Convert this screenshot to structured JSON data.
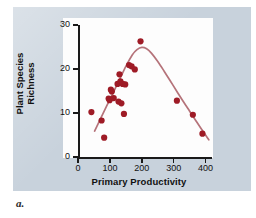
{
  "figure": {
    "caption": "a.",
    "panel_color": "#c8d2dc",
    "plot_background": "#fdfdfd"
  },
  "chart_data": {
    "type": "scatter",
    "title": "",
    "xlabel": "Primary Productivity",
    "ylabel": "Plant Species Richness",
    "ylabel_lines": [
      "Plant Species",
      "Richness"
    ],
    "xlim": [
      0,
      420
    ],
    "ylim": [
      0,
      30
    ],
    "xticks": [
      0,
      100,
      200,
      300,
      400
    ],
    "yticks": [
      0,
      10,
      20,
      30
    ],
    "xticklabels": [
      "0",
      "100",
      "200",
      "300",
      "400"
    ],
    "yticklabels": [
      "0",
      "10",
      "20",
      "30"
    ],
    "grid": false,
    "legend": false,
    "point_color": "#9e1b26",
    "curve_color": "#b5737a",
    "axis_color": "#1a1a1a",
    "points": [
      {
        "x": 42,
        "y": 10.2
      },
      {
        "x": 74,
        "y": 8.3
      },
      {
        "x": 82,
        "y": 4.4
      },
      {
        "x": 96,
        "y": 13.3
      },
      {
        "x": 99,
        "y": 12.9
      },
      {
        "x": 103,
        "y": 15.3
      },
      {
        "x": 106,
        "y": 14.9
      },
      {
        "x": 112,
        "y": 13.4
      },
      {
        "x": 124,
        "y": 16.6
      },
      {
        "x": 127,
        "y": 12.6
      },
      {
        "x": 130,
        "y": 18.8
      },
      {
        "x": 133,
        "y": 17.2
      },
      {
        "x": 136,
        "y": 12.2
      },
      {
        "x": 140,
        "y": 16.6
      },
      {
        "x": 144,
        "y": 9.8
      },
      {
        "x": 148,
        "y": 16.5
      },
      {
        "x": 160,
        "y": 20.9
      },
      {
        "x": 168,
        "y": 20.6
      },
      {
        "x": 178,
        "y": 19.9
      },
      {
        "x": 196,
        "y": 26.3
      },
      {
        "x": 310,
        "y": 12.8
      },
      {
        "x": 360,
        "y": 9.6
      },
      {
        "x": 390,
        "y": 5.3
      }
    ],
    "fit_curve": {
      "name": "hump-shaped fitted trend",
      "x": [
        52,
        70,
        90,
        110,
        130,
        150,
        170,
        185,
        200,
        215,
        230,
        250,
        270,
        290,
        310,
        330,
        350,
        370,
        390,
        410
      ],
      "y": [
        5.9,
        8.6,
        11.6,
        14.6,
        17.6,
        20.6,
        23.2,
        24.4,
        24.9,
        24.6,
        23.6,
        21.7,
        19.5,
        17.2,
        14.9,
        12.6,
        10.4,
        8.2,
        6.0,
        3.9
      ]
    }
  }
}
